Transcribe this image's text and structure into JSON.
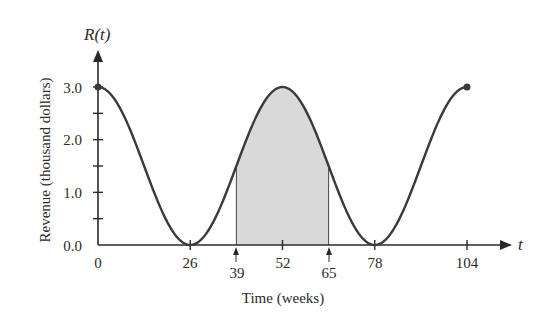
{
  "chart_data": {
    "type": "line",
    "title": "",
    "xlabel": "Time (weeks)",
    "ylabel": "Revenue (thousand dollars)",
    "y_axis_name": "R(t)",
    "x_axis_name": "t",
    "function": "R(t) = 1.5cos(πt/26) + 1.5",
    "xlim": [
      0,
      104
    ],
    "ylim": [
      0,
      3.0
    ],
    "x_ticks": [
      0,
      26,
      39,
      52,
      65,
      78,
      104
    ],
    "y_ticks": [
      0.0,
      0.5,
      1.0,
      1.5,
      2.0,
      2.5,
      3.0
    ],
    "y_tick_labels": [
      "0.0",
      "1.0",
      "2.0",
      "3.0"
    ],
    "series": [
      {
        "name": "R(t)",
        "x": [
          0,
          13,
          26,
          39,
          52,
          65,
          78,
          91,
          104
        ],
        "values": [
          3.0,
          1.5,
          0.0,
          1.5,
          3.0,
          1.5,
          0.0,
          1.5,
          3.0
        ]
      }
    ],
    "shaded_region": {
      "from": 39,
      "to": 65,
      "color": "#d9d9d9"
    },
    "endpoints_marked": [
      [
        0,
        3.0
      ],
      [
        104,
        3.0
      ]
    ],
    "grid": false
  },
  "labels": {
    "y_axis_name": "R(t)",
    "x_axis_name": "t",
    "ylabel": "Revenue (thousand dollars)",
    "xlabel": "Time (weeks)",
    "y0": "0.0",
    "y1": "1.0",
    "y2": "2.0",
    "y3": "3.0",
    "x0": "0",
    "x26": "26",
    "x39": "39",
    "x52": "52",
    "x65": "65",
    "x78": "78",
    "x104": "104"
  },
  "colors": {
    "curve": "#3a3a3a",
    "shade": "#d9d9d9",
    "axis": "#2a2a2a"
  }
}
